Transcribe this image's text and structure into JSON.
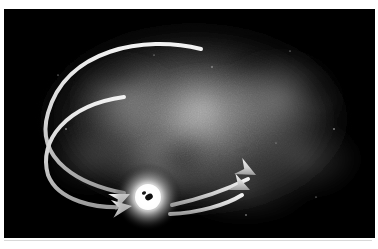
{
  "figure": {
    "medium": "grayscale airbrush illustration",
    "frame_label": "astronomical plate"
  },
  "colors": {
    "page_background": "#ffffff",
    "sky_background": "#000000",
    "nebula_light": "#b9b9b9",
    "nebula_mid": "#6e6e6e",
    "nebula_dark": "#242424",
    "core_white": "#ffffff",
    "core_halo": "#e8e8e8",
    "core_dark_spot": "#101010",
    "arrow_stroke": "#d0d0d0",
    "arrow_highlight": "#f2f2f2",
    "arrow_shadow": "#8a8a8a",
    "star_color": "#cfcfcf",
    "hairline": "#d8d8d8"
  },
  "plate": {
    "x": 4,
    "y": 9,
    "width": 371,
    "height": 229
  },
  "core": {
    "name": "black-hole-core",
    "center_x": 144,
    "center_y": 188,
    "halo_radius": 34,
    "bright_radius": 14,
    "dark_spot_x": 145,
    "dark_spot_y": 188,
    "dark_spot_rx": 4,
    "dark_spot_ry": 3
  },
  "nebula": {
    "name": "nebula-cloud",
    "center_x": 190,
    "center_y": 110,
    "radius_x": 175,
    "radius_y": 105,
    "blobs": [
      {
        "cx": 200,
        "cy": 100,
        "rx": 70,
        "ry": 48,
        "opacity": 0.55
      },
      {
        "cx": 120,
        "cy": 90,
        "rx": 62,
        "ry": 52,
        "opacity": 0.34
      },
      {
        "cx": 275,
        "cy": 90,
        "rx": 74,
        "ry": 56,
        "opacity": 0.36
      },
      {
        "cx": 300,
        "cy": 150,
        "rx": 66,
        "ry": 44,
        "opacity": 0.26
      },
      {
        "cx": 160,
        "cy": 160,
        "rx": 70,
        "ry": 44,
        "opacity": 0.3
      },
      {
        "cx": 240,
        "cy": 180,
        "rx": 80,
        "ry": 38,
        "opacity": 0.22
      },
      {
        "cx": 85,
        "cy": 150,
        "rx": 50,
        "ry": 40,
        "opacity": 0.2
      }
    ],
    "dark_patches": [
      {
        "cx": 178,
        "cy": 150,
        "rx": 30,
        "ry": 24,
        "opacity": 0.55
      },
      {
        "cx": 318,
        "cy": 78,
        "rx": 24,
        "ry": 20,
        "opacity": 0.45
      },
      {
        "cx": 110,
        "cy": 62,
        "rx": 34,
        "ry": 18,
        "opacity": 0.4
      },
      {
        "cx": 250,
        "cy": 52,
        "rx": 30,
        "ry": 16,
        "opacity": 0.35
      }
    ]
  },
  "trajectories": {
    "label": "matter-trajectory-arrows",
    "inbound": [
      {
        "name": "inbound-trajectory-upper",
        "description": "Long curve beginning as a fine taper near the top center, sweeping left and around, terminating in an arrowhead aimed at the core.",
        "path": "M 197 40 C 140 26, 62 40, 44 104 C 30 152, 78 176, 120 184",
        "tip_x": 126,
        "tip_y": 185,
        "angle_deg": 24
      },
      {
        "name": "inbound-trajectory-lower",
        "description": "Second long curve running parallel just inside the first, also ending in an arrowhead aimed at the core.",
        "path": "M 120 88 C 62 96, 34 132, 44 166 C 54 192, 92 200, 122 198",
        "tip_x": 128,
        "tip_y": 197,
        "angle_deg": 8
      }
    ],
    "outbound": [
      {
        "name": "outbound-trajectory-upper",
        "description": "Arrow leaving the core toward the upper right.",
        "path": "M 168 196 C 196 190, 224 180, 244 170",
        "tip_x": 252,
        "tip_y": 166,
        "angle_deg": -27
      },
      {
        "name": "outbound-trajectory-lower",
        "description": "Second arrow leaving the core toward the right, slightly below the first.",
        "path": "M 166 205 C 194 204, 222 196, 238 186",
        "tip_x": 246,
        "tip_y": 181,
        "angle_deg": -24
      }
    ],
    "arrowhead_length": 20,
    "arrowhead_half_width": 9,
    "stroke_width": 4
  },
  "stars": [
    {
      "x": 62,
      "y": 120,
      "r": 0.8
    },
    {
      "x": 96,
      "y": 196,
      "r": 0.7
    },
    {
      "x": 208,
      "y": 58,
      "r": 0.7
    },
    {
      "x": 286,
      "y": 42,
      "r": 0.6
    },
    {
      "x": 330,
      "y": 120,
      "r": 0.8
    },
    {
      "x": 242,
      "y": 206,
      "r": 0.7
    },
    {
      "x": 54,
      "y": 66,
      "r": 0.6
    },
    {
      "x": 312,
      "y": 188,
      "r": 0.6
    },
    {
      "x": 150,
      "y": 46,
      "r": 0.6
    },
    {
      "x": 272,
      "y": 134,
      "r": 0.5
    }
  ]
}
